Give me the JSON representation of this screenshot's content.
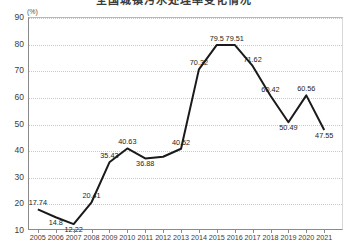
{
  "title": "全国城镇污水处理率变化情况",
  "unit_label": "(%)",
  "chart_data": {
    "type": "line",
    "title": "全国城镇污水处理率变化情况",
    "xlabel": "",
    "ylabel": "(%)",
    "ylim": [
      10,
      90
    ],
    "yticks": [
      10,
      20,
      30,
      40,
      50,
      60,
      70,
      80,
      90
    ],
    "grid": true,
    "legend": "none",
    "categories": [
      "2005",
      "2006",
      "2007",
      "2008",
      "2009",
      "2010",
      "2011",
      "2012",
      "2013",
      "2014",
      "2015",
      "2016",
      "2017",
      "2018",
      "2019",
      "2020",
      "2021"
    ],
    "values": [
      17.74,
      14.8,
      12.22,
      20.41,
      35.43,
      40.63,
      36.88,
      37.5,
      40.52,
      70.32,
      79.5,
      79.51,
      71.62,
      60.42,
      50.49,
      60.56,
      47.55
    ],
    "point_labels": [
      "17.74",
      "14.8",
      "12.22",
      "20.41",
      "35.43",
      "40.63",
      "36.88",
      "",
      "40.52",
      "70.32",
      "79.5",
      "79.51",
      "71.62",
      "60.42",
      "50.49",
      "60.56",
      "47.55"
    ],
    "line_color": "#1a1a1a"
  }
}
